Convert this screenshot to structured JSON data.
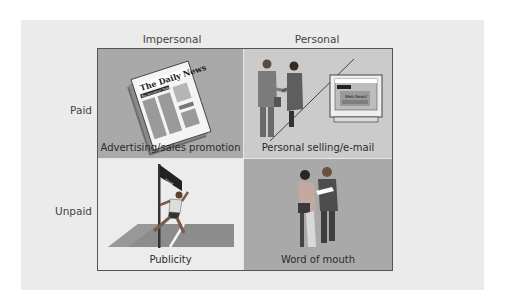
{
  "diagram": {
    "type": "2x2 matrix",
    "columns": [
      {
        "label": "Impersonal"
      },
      {
        "label": "Personal"
      }
    ],
    "rows": [
      {
        "label": "Paid"
      },
      {
        "label": "Unpaid"
      }
    ],
    "cells": [
      {
        "row": "Paid",
        "column": "Impersonal",
        "caption": "Advertising/sales promotion",
        "illustration": "newspaper-icon",
        "newspaper_title": "The Daily News",
        "newspaper_subtitle": "Big Sensation Today"
      },
      {
        "row": "Paid",
        "column": "Personal",
        "caption": "Personal selling/e-mail",
        "illustration": "handshake-and-computer-icon",
        "screen_text": "Web News!"
      },
      {
        "row": "Unpaid",
        "column": "Impersonal",
        "caption": "Publicity",
        "illustration": "runner-finish-line-icon",
        "banner_text": "TAPE"
      },
      {
        "row": "Unpaid",
        "column": "Personal",
        "caption": "Word of mouth",
        "illustration": "two-people-talking-icon"
      }
    ]
  },
  "colors": {
    "panel_bg": "#ebebeb",
    "cell_dark": "#a9a9a9",
    "cell_medium": "#cbcbcb",
    "cell_light": "#ececec",
    "grid_border": "#555555",
    "text": "#3a3a3a"
  }
}
